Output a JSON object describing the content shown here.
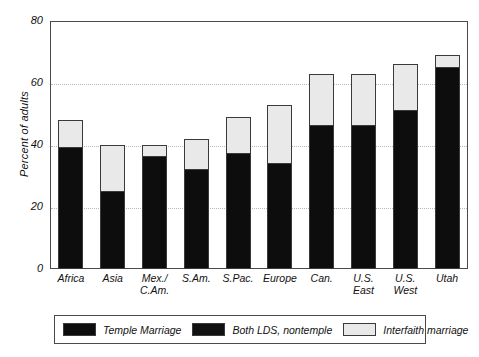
{
  "chart_data": {
    "type": "bar",
    "stacked": true,
    "title": "",
    "xlabel": "",
    "ylabel": "Percent of adults",
    "ylim": [
      0,
      80
    ],
    "yticks": [
      0,
      20,
      40,
      60,
      80
    ],
    "grid": true,
    "legend_position": "bottom",
    "categories": [
      "Africa",
      "Asia",
      "Mex./\nC.Am.",
      "S.Am.",
      "S.Pac.",
      "Europe",
      "Can.",
      "U.S.\nEast",
      "U.S.\nWest",
      "Utah"
    ],
    "series": [
      {
        "name": "Temple Marriage",
        "color": "#0d0d0d",
        "values": [
          39,
          25,
          36,
          32,
          37,
          34,
          46,
          46,
          51,
          65
        ]
      },
      {
        "name": "Both LDS, nontemple",
        "color": "#111111",
        "values": [
          0,
          0,
          0,
          0,
          0,
          0,
          0,
          0,
          0,
          0
        ]
      },
      {
        "name": "Interfaith marriage",
        "color": "#e9e9e9",
        "values": [
          9,
          15,
          4,
          10,
          12,
          19,
          17,
          17,
          15,
          4
        ]
      }
    ],
    "totals": [
      48,
      40,
      40,
      42,
      49,
      53,
      63,
      63,
      66,
      69
    ]
  },
  "axes": {
    "y_title": "Percent of adults",
    "y_ticks": [
      "80",
      "60",
      "40",
      "20",
      "0"
    ],
    "x_ticks": [
      {
        "line1": "Africa",
        "line2": ""
      },
      {
        "line1": "Asia",
        "line2": ""
      },
      {
        "line1": "Mex./",
        "line2": "C.Am."
      },
      {
        "line1": "S.Am.",
        "line2": ""
      },
      {
        "line1": "S.Pac.",
        "line2": ""
      },
      {
        "line1": "Europe",
        "line2": ""
      },
      {
        "line1": "Can.",
        "line2": ""
      },
      {
        "line1": "U.S.",
        "line2": "East"
      },
      {
        "line1": "U.S.",
        "line2": "West"
      },
      {
        "line1": "Utah",
        "line2": ""
      }
    ]
  },
  "legend": {
    "items": [
      {
        "label": "Temple Marriage",
        "swatch": "black"
      },
      {
        "label": "Both LDS, nontemple",
        "swatch": "black2"
      },
      {
        "label": "Interfaith marriage",
        "swatch": "light"
      }
    ]
  }
}
